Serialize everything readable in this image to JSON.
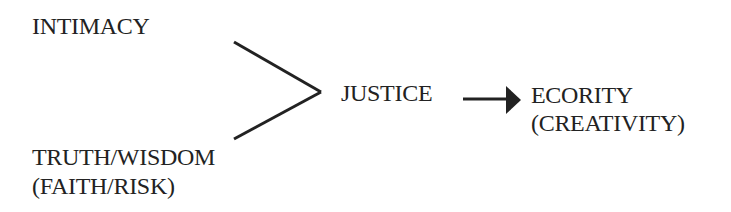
{
  "nodes": {
    "intimacy": "INTIMACY",
    "truth_line1": "TRUTH/WISDOM",
    "truth_line2": "(FAITH/RISK)",
    "justice": "JUSTICE",
    "ecority_line1": "ECORITY",
    "ecority_line2": "(CREATIVITY)"
  },
  "edges": [
    {
      "from": "intimacy",
      "to": "justice",
      "type": "line"
    },
    {
      "from": "truth_wisdom",
      "to": "justice",
      "type": "line"
    },
    {
      "from": "justice",
      "to": "ecority",
      "type": "arrow"
    }
  ],
  "colors": {
    "ink": "#222222",
    "background": "#ffffff"
  }
}
